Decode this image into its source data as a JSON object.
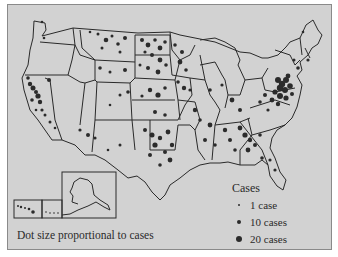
{
  "map": {
    "subject": "Contiguous United States with Alaska and Hawaii insets",
    "caption": "Dot size proportional to cases",
    "background_color": "#d2d2d2",
    "border_color": "#2a2a2a",
    "dot_color": "#2b2b2b",
    "insets": [
      "Alaska",
      "Hawaii"
    ],
    "dense_regions": [
      "Mid-Atlantic (Pennsylvania, Maryland, Virginia)",
      "Georgia",
      "Northern Plains",
      "Texas",
      "California"
    ]
  },
  "legend": {
    "title": "Cases",
    "items": [
      {
        "label": "1 case",
        "size": 2
      },
      {
        "label": "10 cases",
        "size": 3.5
      },
      {
        "label": "20 cases",
        "size": 5
      }
    ]
  }
}
